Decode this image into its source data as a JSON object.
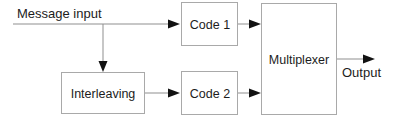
{
  "diagram": {
    "type": "block-diagram",
    "width": 403,
    "height": 128,
    "background_color": "#ffffff",
    "box_border_color": "#a9a9a9",
    "box_fill_color": "#ffffff",
    "connector_color": "#8f8f8f",
    "arrow_color": "#121212",
    "text_color": "#1c1c1c",
    "blocks": [
      {
        "id": "code1",
        "label": "Code 1",
        "x": 181,
        "y": 2,
        "width": 57,
        "height": 44
      },
      {
        "id": "interleaving",
        "label": "Interleaving",
        "x": 61,
        "y": 72,
        "width": 84,
        "height": 42
      },
      {
        "id": "code2",
        "label": "Code 2",
        "x": 181,
        "y": 71,
        "width": 57,
        "height": 44
      },
      {
        "id": "multiplexer",
        "label": "Multiplexer",
        "x": 261,
        "y": 3,
        "width": 76,
        "height": 112
      }
    ],
    "free_labels": [
      {
        "id": "message-input",
        "text": "Message input",
        "x": 17,
        "y": 18
      },
      {
        "id": "output",
        "text": "Output",
        "x": 342,
        "y": 77
      }
    ],
    "connections": [
      {
        "id": "input-to-code1",
        "from": "message-input",
        "to": "code1",
        "label": ""
      },
      {
        "id": "input-to-interleaving",
        "from": "message-input",
        "to": "interleaving",
        "label": ""
      },
      {
        "id": "interleaving-to-code2",
        "from": "interleaving",
        "to": "code2",
        "label": ""
      },
      {
        "id": "code1-to-multiplexer",
        "from": "code1",
        "to": "multiplexer",
        "label": ""
      },
      {
        "id": "code2-to-multiplexer",
        "from": "code2",
        "to": "multiplexer",
        "label": ""
      },
      {
        "id": "multiplexer-to-output",
        "from": "multiplexer",
        "to": "output",
        "label": ""
      }
    ]
  }
}
